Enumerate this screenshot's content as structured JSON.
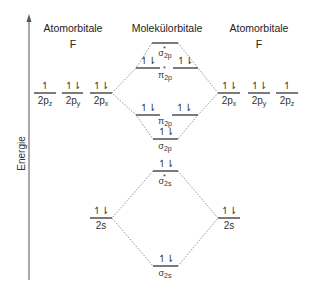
{
  "headers": {
    "left_title": "Atomorbitale",
    "left_element": "F",
    "center_title": "Molekülorbitale",
    "right_title": "Atomorbitale",
    "right_element": "F"
  },
  "axis": {
    "label": "Energie"
  },
  "left_atom": {
    "p_orbitals": [
      {
        "name": "2p",
        "sub": "z",
        "electrons": "↿"
      },
      {
        "name": "2p",
        "sub": "y",
        "electrons": "↿⇂"
      },
      {
        "name": "2p",
        "sub": "x",
        "electrons": "↿⇂"
      }
    ],
    "s_orbital": {
      "name": "2s",
      "electrons": "↿⇂"
    }
  },
  "right_atom": {
    "p_orbitals": [
      {
        "name": "2p",
        "sub": "x",
        "electrons": "↿⇂"
      },
      {
        "name": "2p",
        "sub": "y",
        "electrons": "↿⇂"
      },
      {
        "name": "2p",
        "sub": "z",
        "electrons": "↿"
      }
    ],
    "s_orbital": {
      "name": "2s",
      "electrons": "↿⇂"
    }
  },
  "molecular_orbitals": [
    {
      "id": "sigma_star_2p",
      "symbol": "σ",
      "sub": "2p",
      "antibonding": true,
      "electrons": ""
    },
    {
      "id": "pi_star_2p",
      "symbol": "π",
      "sub": "2p",
      "antibonding": true,
      "electrons": [
        "↿⇂",
        "↿⇂"
      ]
    },
    {
      "id": "pi_2p",
      "symbol": "π",
      "sub": "2p",
      "antibonding": false,
      "electrons": [
        "↿⇂",
        "↿⇂"
      ]
    },
    {
      "id": "sigma_2p",
      "symbol": "σ",
      "sub": "2p",
      "antibonding": false,
      "electrons": "↿⇂"
    },
    {
      "id": "sigma_star_2s",
      "symbol": "σ",
      "sub": "2s",
      "antibonding": true,
      "electrons": "↿⇂"
    },
    {
      "id": "sigma_2s",
      "symbol": "σ",
      "sub": "2s",
      "antibonding": false,
      "electrons": "↿⇂"
    }
  ],
  "star_symbol": "*"
}
